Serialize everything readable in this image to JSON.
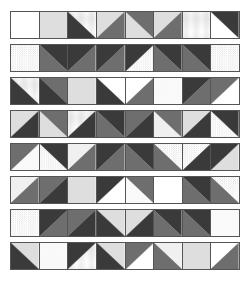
{
  "colors": {
    "dark": "#3a3a3a",
    "medium": "#6e6e6e",
    "white": "#ffffff",
    "light": "#f0f0f0",
    "line": "#555555"
  },
  "rows": [
    [
      "dm-w:/:dark|white",
      "speckle",
      "grid|dark:\\",
      "speckle|medium:/",
      "medium|speckle:\\",
      "speckle|medium:/",
      "grid",
      "dark|white:\\"
    ],
    [
      "dots",
      "dark|medium:\\",
      "dark|medium:/",
      "dark|medium:/",
      "dark|dots:/",
      "dark|medium:\\",
      "dark|medium:\\",
      "dots"
    ],
    [
      "grid|dark:\\",
      "medium|dark:\\",
      "speckle",
      "white|dark:\\",
      "white|medium:/",
      "swirl",
      "dark|medium:/",
      "medium|white:/"
    ],
    [
      "speckle|dark:/",
      "medium|speckle:\\",
      "grid|dark:/",
      "dark|medium:\\",
      "medium|dark:/",
      "medium|lines:\\",
      "speckle|dark:/",
      "dark|dots:\\"
    ],
    [
      "medium|swirl:/",
      "dark|dots:\\",
      "lines|medium:/",
      "dark|medium:/",
      "dark|medium:\\",
      "dots|medium:\\",
      "dots|dark:/",
      "dark|speckle:/"
    ],
    [
      "lines|medium:/",
      "medium|dark:/",
      "speckle",
      "dark|white:/",
      "medium|swirl:\\",
      "white",
      "dark|medium:\\",
      "dots|medium:\\"
    ],
    [
      "dots",
      "dark|medium:/",
      "medium|dark:/",
      "speckle|dark:\\",
      "speckle|dark:/",
      "dark|medium:\\",
      "dark|medium:\\",
      "swirl"
    ],
    [
      "speckle|dark:\\",
      "swirl",
      "dark|grid:/",
      "speckle|dark:\\",
      "medium|white:/",
      "lines|medium:\\",
      "speckle",
      "white|medium:/"
    ]
  ]
}
